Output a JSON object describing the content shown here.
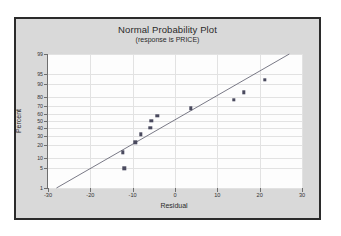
{
  "chart_data": {
    "type": "scatter",
    "title": "Normal Probability Plot",
    "subtitle": "(response is PRICE)",
    "xlabel": "Residual",
    "ylabel": "Percent",
    "xlim": [
      -30,
      30
    ],
    "xticks": [
      -30,
      -20,
      -10,
      0,
      10,
      20,
      30
    ],
    "xtick_labels": [
      "-30",
      "-20",
      "-10",
      "0",
      "10",
      "20",
      "30"
    ],
    "ylim": [
      1,
      99
    ],
    "yticks": [
      1,
      5,
      10,
      20,
      30,
      40,
      50,
      60,
      70,
      80,
      90,
      95,
      99
    ],
    "ytick_labels": [
      "1",
      "5",
      "10",
      "20",
      "30",
      "40",
      "50",
      "60",
      "70",
      "80",
      "90",
      "95",
      "99"
    ],
    "yscale": "normal-probability",
    "grid": true,
    "legend": "none",
    "points": [
      {
        "x": -12.0,
        "y": 5.0
      },
      {
        "x": -12.3,
        "y": 14.0
      },
      {
        "x": -9.4,
        "y": 23.0
      },
      {
        "x": -8.1,
        "y": 32.0
      },
      {
        "x": -5.8,
        "y": 41.0
      },
      {
        "x": -5.6,
        "y": 50.0
      },
      {
        "x": -4.2,
        "y": 57.5
      },
      {
        "x": 3.7,
        "y": 67.0
      },
      {
        "x": 13.9,
        "y": 77.0
      },
      {
        "x": 16.3,
        "y": 84.0
      },
      {
        "x": 21.2,
        "y": 92.5
      }
    ],
    "reference_line": {
      "x1": -28.0,
      "y1": 1.0,
      "x2": 27.0,
      "y2": 99.0,
      "color": "#6a6a78"
    }
  },
  "figure": {
    "background_color": "#d9d9d9",
    "border_color": "#2b2b2b",
    "plot_background_color": "#fdfdfd",
    "grid_color": "#e2e2e2",
    "marker_color": "#4a4a5e"
  }
}
